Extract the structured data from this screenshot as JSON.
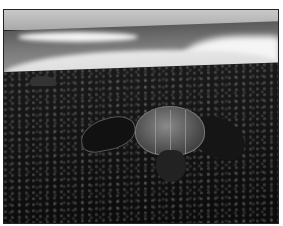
{
  "image": {
    "description": "Black-and-white photo of a leatherback sea turtle crawling on a dark pebbly beach with breaking ocean waves in the background",
    "subjects": [
      "leatherback-turtle",
      "pebble-beach",
      "ocean-waves",
      "sky",
      "rock"
    ],
    "tone": "grayscale",
    "frame_color": "#222222",
    "margin_color": "#ffffff"
  }
}
